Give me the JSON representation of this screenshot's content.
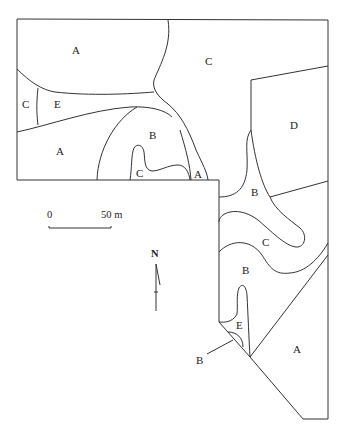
{
  "map": {
    "type": "zone map",
    "zones": [
      {
        "id": "zone-a-top-left",
        "label": "A"
      },
      {
        "id": "zone-c-top",
        "label": "C"
      },
      {
        "id": "zone-c-left",
        "label": "C"
      },
      {
        "id": "zone-e-left",
        "label": "E"
      },
      {
        "id": "zone-a-mid-left",
        "label": "A"
      },
      {
        "id": "zone-b-center",
        "label": "B"
      },
      {
        "id": "zone-c-small",
        "label": "C"
      },
      {
        "id": "zone-a-small",
        "label": "A"
      },
      {
        "id": "zone-d-right",
        "label": "D"
      },
      {
        "id": "zone-b-right",
        "label": "B"
      },
      {
        "id": "zone-c-right",
        "label": "C"
      },
      {
        "id": "zone-b-lower",
        "label": "B"
      },
      {
        "id": "zone-e-lower",
        "label": "E"
      },
      {
        "id": "zone-b-callout",
        "label": "B"
      },
      {
        "id": "zone-a-bottom-right",
        "label": "A"
      }
    ],
    "scale_bar": {
      "start": "0",
      "end": "50 m"
    },
    "north_arrow": {
      "label": "N"
    },
    "colors": {
      "line": "#333333",
      "background": "#ffffff"
    }
  }
}
